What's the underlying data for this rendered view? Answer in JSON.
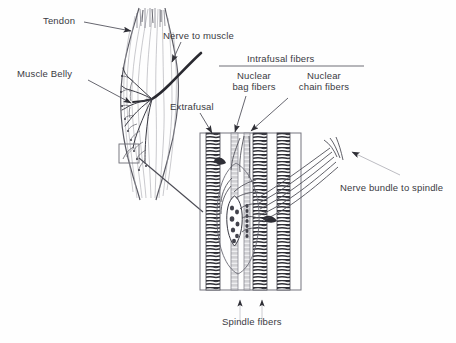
{
  "figure": {
    "background_color": "#fefefe",
    "ink_color": "#3a3a42",
    "line_color": "#55555f",
    "width": 456,
    "height": 343
  },
  "labels": {
    "tendon": "Tendon",
    "muscle_belly": "Muscle Belly",
    "nerve_to_muscle": "Nerve to muscle",
    "extrafusal": "Extrafusal",
    "intrafusal_fibers": "Intrafusal fibers",
    "nuclear_bag_line1": "Nuclear",
    "nuclear_bag_line2": "bag fibers",
    "nuclear_chain_line1": "Nuclear",
    "nuclear_chain_line2": "chain fibers",
    "nerve_bundle_to_spindle": "Nerve bundle to spindle",
    "spindle_fibers": "Spindle fibers"
  },
  "structures": {
    "muscle_belly_shape": "fusiform-muscle-outline",
    "detail_box": "magnified-spindle-box",
    "inset_box": "magnification-source-box",
    "extrafusal_fiber_count": 3,
    "intrafusal_fiber_count": 2,
    "spindle_capsule": "ellipse-capsule",
    "nerve_bundle": "parallel-nerve-strands",
    "spindle_fiber_arrows": 2
  }
}
